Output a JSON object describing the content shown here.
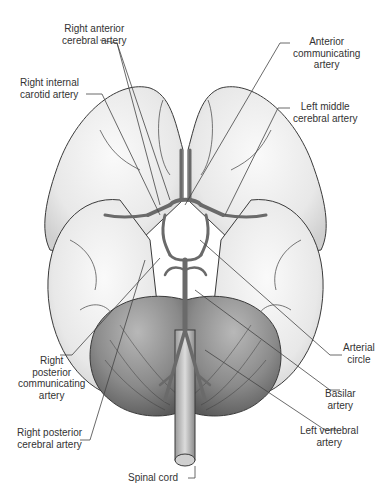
{
  "figure": {
    "colors": {
      "outline": "#3a3a3a",
      "cerebrum_fill": "#ececec",
      "cerebellum_fill": "#8a8a8a",
      "artery_fill": "#6e6e6e",
      "label_text": "#333333",
      "leader_line": "#444444"
    }
  },
  "labels": {
    "right_anterior_cerebral": {
      "line1": "Right anterior",
      "line2": "cerebral artery"
    },
    "anterior_communicating": {
      "line1": "Anterior",
      "line2": "communicating",
      "line3": "artery"
    },
    "right_internal_carotid": {
      "line1": "Right internal",
      "line2": "carotid artery"
    },
    "left_middle_cerebral": {
      "line1": "Left middle",
      "line2": "cerebral artery"
    },
    "arterial_circle": {
      "line1": "Arterial",
      "line2": "circle"
    },
    "right_posterior_communicating": {
      "line1": "Right",
      "line2": "posterior",
      "line3": "communicating",
      "line4": "artery"
    },
    "basilar": {
      "line1": "Basilar",
      "line2": "artery"
    },
    "right_posterior_cerebral": {
      "line1": "Right posterior",
      "line2": "cerebral  artery"
    },
    "left_vertebral": {
      "line1": "Left vertebral",
      "line2": "artery"
    },
    "spinal_cord": {
      "line1": "Spinal cord"
    }
  }
}
